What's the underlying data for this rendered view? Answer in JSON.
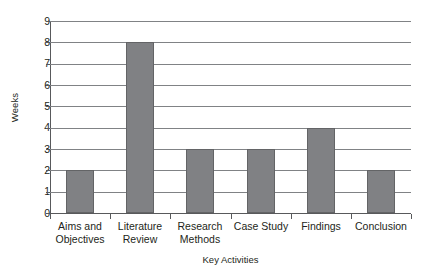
{
  "chart_data": {
    "type": "bar",
    "title": "",
    "xlabel": "Key Activities",
    "ylabel": "Weeks",
    "categories": [
      "Aims and Objectives",
      "Literature Review",
      "Research Methods",
      "Case Study",
      "Findings",
      "Conclusion"
    ],
    "category_lines": [
      [
        "Aims and",
        "Objectives"
      ],
      [
        "Literature",
        "Review"
      ],
      [
        "Research",
        "Methods"
      ],
      [
        "Case Study",
        ""
      ],
      [
        "Findings",
        ""
      ],
      [
        "Conclusion",
        ""
      ]
    ],
    "values": [
      2,
      8,
      3,
      3,
      4,
      2
    ],
    "ylim": [
      0,
      9
    ],
    "yticks": [
      0,
      1,
      2,
      3,
      4,
      5,
      6,
      7,
      8,
      9
    ],
    "ytick_labels": [
      "0",
      "1",
      "2",
      "3",
      "4",
      "5",
      "6",
      "7",
      "8",
      "9"
    ],
    "grid": true,
    "grid_axis": "y",
    "legend": false,
    "legend_position": "none",
    "bar_fill_color": "#808184",
    "bar_edge_color": "#636466",
    "grid_color": "#808285",
    "axis_color": "#58595b",
    "text_color": "#231f20",
    "background_color": "#ffffff"
  }
}
